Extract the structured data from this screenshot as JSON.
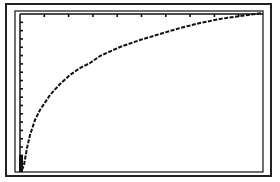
{
  "screen": {
    "description": "Graphing calculator screen showing a logarithmic-shaped curve",
    "colors": {
      "background": "#ffffff",
      "ink": "#111111",
      "frame": "#222222"
    }
  },
  "chart_data": {
    "type": "line",
    "title": "",
    "xlabel": "",
    "ylabel": "",
    "grid": false,
    "legend": null,
    "axes": {
      "x_axis_position": "top",
      "y_axis_position": "left",
      "x_tick_count": 10,
      "y_tick_count": 19
    },
    "series": [
      {
        "name": "f(x)",
        "shape": "logarithmic (y = ln x style)",
        "pixel_points": [
          [
            22,
            170
          ],
          [
            24,
            165
          ],
          [
            27,
            148
          ],
          [
            30,
            135
          ],
          [
            35,
            120
          ],
          [
            40,
            110
          ],
          [
            50,
            95
          ],
          [
            60,
            84
          ],
          [
            70,
            75
          ],
          [
            80,
            68
          ],
          [
            90,
            63
          ],
          [
            100,
            56
          ],
          [
            120,
            47
          ],
          [
            140,
            40
          ],
          [
            160,
            34
          ],
          [
            180,
            28
          ],
          [
            200,
            23
          ],
          [
            220,
            19
          ],
          [
            240,
            16
          ],
          [
            262,
            13
          ]
        ]
      }
    ],
    "plot_region_px": {
      "x0": 20,
      "y0": 14,
      "x1": 263,
      "y1": 172
    }
  }
}
